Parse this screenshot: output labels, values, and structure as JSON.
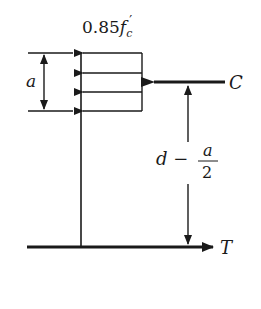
{
  "diagram": {
    "stress_label": {
      "coef": "0.85",
      "var": "f",
      "sub": "c",
      "prime": "′"
    },
    "depth_label": "a",
    "compression_label": "C",
    "tension_label": "T",
    "lever_arm": {
      "left": "d −",
      "num": "a",
      "den": "2"
    },
    "colors": {
      "ink": "#1a1a1a",
      "background": "#ffffff"
    }
  }
}
